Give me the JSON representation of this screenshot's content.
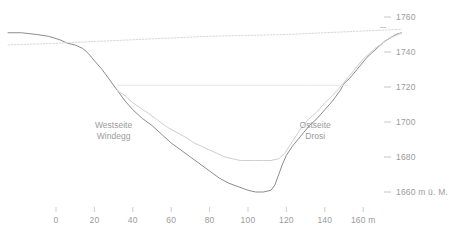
{
  "chart_data": {
    "type": "line",
    "title": "",
    "subtitle": "",
    "xlabel": "m",
    "ylabel": "m ü. M.",
    "xlim": [
      -30,
      185
    ],
    "ylim": [
      1655,
      1765
    ],
    "grid": false,
    "legend_position": "none",
    "x_ticks": [
      0,
      20,
      40,
      60,
      80,
      100,
      120,
      140,
      160
    ],
    "x_tick_labels": [
      "0",
      "20",
      "40",
      "60",
      "80",
      "100",
      "120",
      "140",
      "160 m"
    ],
    "y_ticks": [
      1660,
      1680,
      1700,
      1720,
      1740,
      1760
    ],
    "y_tick_labels": [
      "1660 m ü. M.",
      "1680",
      "1700",
      "1720",
      "1740",
      "1760"
    ],
    "annotations": [
      {
        "text_line1": "Westseite",
        "text_line2": "Windegg",
        "x": 30,
        "y": 1696
      },
      {
        "text_line1": "Ostseite",
        "text_line2": "Drosi",
        "x": 135,
        "y": 1696
      }
    ],
    "series": [
      {
        "name": "Felsoberfläche",
        "style": "solid",
        "color": "#8c8c8c",
        "width": 1.0,
        "points": [
          [
            -25,
            1751
          ],
          [
            -18,
            1751
          ],
          [
            -10,
            1750
          ],
          [
            -4,
            1749
          ],
          [
            2,
            1747
          ],
          [
            6,
            1745
          ],
          [
            10,
            1744
          ],
          [
            14,
            1742
          ],
          [
            17,
            1739
          ],
          [
            20,
            1735
          ],
          [
            24,
            1730
          ],
          [
            28,
            1724
          ],
          [
            32,
            1718
          ],
          [
            36,
            1712
          ],
          [
            40,
            1707
          ],
          [
            45,
            1702
          ],
          [
            50,
            1698
          ],
          [
            55,
            1693
          ],
          [
            60,
            1688
          ],
          [
            65,
            1684
          ],
          [
            70,
            1680
          ],
          [
            75,
            1676
          ],
          [
            80,
            1672
          ],
          [
            85,
            1668
          ],
          [
            90,
            1665
          ],
          [
            95,
            1663
          ],
          [
            100,
            1661
          ],
          [
            104,
            1660
          ],
          [
            108,
            1660
          ],
          [
            112,
            1661
          ],
          [
            114,
            1664
          ],
          [
            116,
            1670
          ],
          [
            118,
            1676
          ],
          [
            120,
            1681
          ],
          [
            123,
            1686
          ],
          [
            126,
            1690
          ],
          [
            129,
            1694
          ],
          [
            132,
            1698
          ],
          [
            136,
            1702
          ],
          [
            140,
            1707
          ],
          [
            144,
            1712
          ],
          [
            148,
            1718
          ],
          [
            150,
            1722
          ],
          [
            153,
            1725
          ],
          [
            156,
            1729
          ],
          [
            159,
            1733
          ],
          [
            162,
            1737
          ],
          [
            165,
            1740
          ],
          [
            168,
            1743
          ],
          [
            171,
            1746
          ],
          [
            174,
            1748
          ],
          [
            177,
            1750
          ],
          [
            180,
            1751
          ]
        ]
      },
      {
        "name": "Lockergesteinsoberfläche",
        "style": "solid",
        "color": "#cfcfcf",
        "width": 1.0,
        "points": [
          [
            32,
            1718
          ],
          [
            36,
            1715
          ],
          [
            40,
            1711
          ],
          [
            44,
            1708
          ],
          [
            48,
            1705
          ],
          [
            53,
            1701
          ],
          [
            58,
            1697
          ],
          [
            63,
            1694
          ],
          [
            68,
            1691
          ],
          [
            72,
            1688
          ],
          [
            76,
            1686
          ],
          [
            80,
            1684
          ],
          [
            84,
            1682
          ],
          [
            88,
            1680
          ],
          [
            92,
            1679
          ],
          [
            96,
            1678
          ],
          [
            100,
            1678
          ],
          [
            104,
            1678
          ],
          [
            108,
            1678
          ],
          [
            112,
            1678
          ],
          [
            116,
            1679
          ],
          [
            119,
            1682
          ],
          [
            122,
            1687
          ],
          [
            125,
            1692
          ],
          [
            128,
            1697
          ],
          [
            131,
            1701
          ],
          [
            134,
            1704
          ],
          [
            137,
            1707
          ],
          [
            140,
            1711
          ],
          [
            144,
            1715
          ],
          [
            148,
            1720
          ],
          [
            151,
            1724
          ],
          [
            154,
            1728
          ],
          [
            157,
            1732
          ],
          [
            160,
            1736
          ],
          [
            163,
            1739
          ],
          [
            166,
            1742
          ],
          [
            170,
            1745
          ],
          [
            174,
            1748
          ],
          [
            178,
            1750
          ],
          [
            180,
            1751
          ]
        ]
      },
      {
        "name": "Stauspiegel",
        "style": "solid",
        "color": "#e4e4e4",
        "width": 0.9,
        "points": [
          [
            32,
            1721
          ],
          [
            60,
            1721
          ],
          [
            100,
            1721
          ],
          [
            130,
            1721
          ],
          [
            152,
            1721
          ]
        ]
      },
      {
        "name": "Kronenlinie",
        "style": "dotted",
        "color": "#d8d8d8",
        "width": 1.0,
        "points": [
          [
            -25,
            1744
          ],
          [
            0,
            1745
          ],
          [
            40,
            1747
          ],
          [
            80,
            1749
          ],
          [
            120,
            1750
          ],
          [
            160,
            1752
          ],
          [
            180,
            1753
          ]
        ]
      }
    ]
  },
  "axes": {
    "y_tick_color": "#b8b8b8",
    "x_tick_color": "#c2c2c2",
    "label_color": "#9b9b9b"
  }
}
